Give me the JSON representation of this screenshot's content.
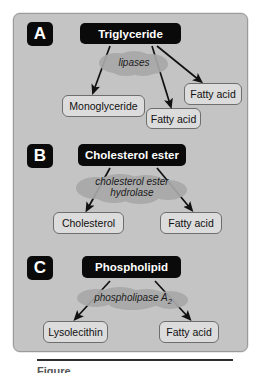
{
  "figure": {
    "background_color": "#ffffff",
    "card_color": "#c4c4c4",
    "substrate_box_color": "#0a0a0a",
    "product_box_color": "#dcdcdc",
    "arrow_color": "#111111"
  },
  "panels": [
    {
      "letter": "A",
      "substrate": "Triglyceride",
      "enzyme": "lipases",
      "enzyme_line2": "",
      "products": [
        {
          "label": "Monoglyceride"
        },
        {
          "label": "Fatty acid"
        },
        {
          "label": "Fatty acid"
        }
      ]
    },
    {
      "letter": "B",
      "substrate": "Cholesterol ester",
      "enzyme": "cholesterol ester",
      "enzyme_line2": "hydrolase",
      "products": [
        {
          "label": "Cholesterol"
        },
        {
          "label": "Fatty acid"
        }
      ]
    },
    {
      "letter": "C",
      "substrate": "Phospholipid",
      "enzyme": "phospholipase A",
      "enzyme_subscript": "2",
      "enzyme_line2": "",
      "products": [
        {
          "label": "Lysolecithin"
        },
        {
          "label": "Fatty acid"
        }
      ]
    }
  ],
  "caption": {
    "text": "Figure"
  }
}
